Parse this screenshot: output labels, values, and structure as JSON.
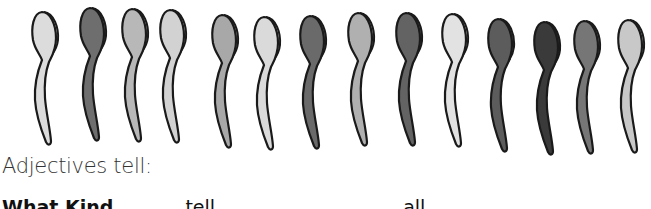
{
  "illustration": {
    "subject": "row of spoons",
    "spoon_count": 15,
    "spoons": [
      {
        "x": 28,
        "y": 8,
        "h": 128,
        "fill": "#dcdcdc"
      },
      {
        "x": 76,
        "y": 4,
        "h": 128,
        "fill": "#6e6e6e"
      },
      {
        "x": 118,
        "y": 5,
        "h": 128,
        "fill": "#b8b8b8"
      },
      {
        "x": 156,
        "y": 6,
        "h": 128,
        "fill": "#d2d2d2"
      },
      {
        "x": 208,
        "y": 11,
        "h": 128,
        "fill": "#a8a8a8"
      },
      {
        "x": 250,
        "y": 13,
        "h": 128,
        "fill": "#dadada"
      },
      {
        "x": 296,
        "y": 12,
        "h": 128,
        "fill": "#6a6a6a"
      },
      {
        "x": 344,
        "y": 9,
        "h": 128,
        "fill": "#b0b0b0"
      },
      {
        "x": 392,
        "y": 9,
        "h": 128,
        "fill": "#636363"
      },
      {
        "x": 438,
        "y": 10,
        "h": 128,
        "fill": "#e2e2e2"
      },
      {
        "x": 484,
        "y": 15,
        "h": 128,
        "fill": "#5c5c5c"
      },
      {
        "x": 530,
        "y": 18,
        "h": 128,
        "fill": "#3a3a3a"
      },
      {
        "x": 570,
        "y": 17,
        "h": 128,
        "fill": "#767676"
      },
      {
        "x": 614,
        "y": 16,
        "h": 128,
        "fill": "#c8c8c8"
      }
    ]
  },
  "text": {
    "heading": "Adjectives tell:",
    "clipped_line_bold": "What Kind",
    "clipped_line_rest": [
      "tell",
      "all"
    ]
  }
}
